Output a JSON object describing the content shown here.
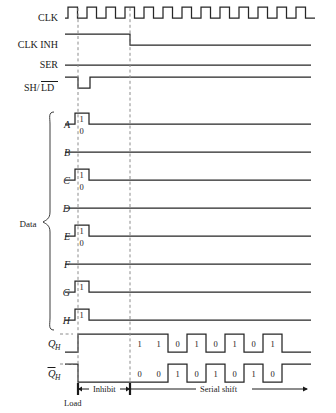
{
  "geometry": {
    "x_start": 65,
    "x_end": 311,
    "dash1_x": 78,
    "dash2_x": 130,
    "cell_w": 19,
    "clk_periods": 13
  },
  "colors": {
    "wave": "#262626",
    "dashed_guide": "#8c8c8c",
    "text": "#1a1a1a",
    "background": "#ffffff"
  },
  "signals": [
    {
      "name": "CLK",
      "label": "CLK",
      "overline": "",
      "y": 18,
      "type": "clock"
    },
    {
      "name": "CLK_INH",
      "label": "CLK INH",
      "overline": "",
      "y": 45,
      "type": "falling_at_dash2"
    },
    {
      "name": "SER",
      "label": "SER",
      "overline": "",
      "y": 65,
      "type": "constant_low"
    },
    {
      "name": "SH_LD",
      "label": "SH/",
      "overline": "LD",
      "y": 88,
      "type": "load_pulse_low"
    }
  ],
  "data_group": {
    "label": "Data",
    "bit_high_label": "1",
    "bit_low_label": "0",
    "lines": [
      {
        "name": "A",
        "label": "A",
        "y": 124,
        "value": 1,
        "bit_label": "1",
        "low_label": "0"
      },
      {
        "name": "B",
        "label": "B",
        "y": 152,
        "value": 0,
        "bit_label": "",
        "low_label": ""
      },
      {
        "name": "C",
        "label": "C",
        "y": 180,
        "value": 1,
        "bit_label": "1",
        "low_label": "0"
      },
      {
        "name": "D",
        "label": "D",
        "y": 208,
        "value": 0,
        "bit_label": "",
        "low_label": ""
      },
      {
        "name": "E",
        "label": "E",
        "y": 236,
        "value": 1,
        "bit_label": "1",
        "low_label": "0"
      },
      {
        "name": "F",
        "label": "F",
        "y": 264,
        "value": 0,
        "bit_label": "",
        "low_label": ""
      },
      {
        "name": "G",
        "label": "G",
        "y": 292,
        "value": 1,
        "bit_label": "1",
        "low_label": ""
      },
      {
        "name": "H",
        "label": "H",
        "y": 320,
        "value": 1,
        "bit_label": "1",
        "low_label": ""
      }
    ]
  },
  "outputs": [
    {
      "name": "QH",
      "label": "Q",
      "subscript": "H",
      "overline": false,
      "y": 343,
      "bits": [
        1,
        1,
        0,
        1,
        0,
        1,
        0,
        1
      ],
      "bit_labels": [
        "1",
        "1",
        "0",
        "1",
        "0",
        "1",
        "0",
        "1"
      ]
    },
    {
      "name": "QH_bar",
      "label": "Q",
      "subscript": "H",
      "overline": true,
      "y": 373,
      "bits": [
        0,
        0,
        1,
        0,
        1,
        0,
        1,
        0
      ],
      "bit_labels": [
        "0",
        "0",
        "1",
        "0",
        "1",
        "0",
        "1",
        "0"
      ]
    }
  ],
  "annotations": {
    "inhibit": "Inhibit",
    "serial_shift": "Serial shift",
    "load": "Load"
  }
}
